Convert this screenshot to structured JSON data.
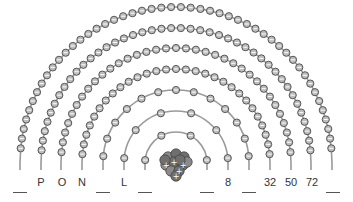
{
  "nucleus": {
    "center_x": 176,
    "center_y": 163,
    "radius": 14,
    "color": "#6f6f6f",
    "symbol": "+"
  },
  "colors": {
    "shell": "#9a9a9a",
    "electron_fill": "#bdbdbd",
    "electron_stroke": "#555555",
    "label": "#333333"
  },
  "shells": [
    {
      "name": "K",
      "radius": 31,
      "electrons": 2
    },
    {
      "name": "L",
      "radius": 52,
      "electrons": 8
    },
    {
      "name": "M",
      "radius": 73,
      "electrons": 18
    },
    {
      "name": "N",
      "radius": 94,
      "electrons": 32
    },
    {
      "name": "O",
      "radius": 115,
      "electrons": 50
    },
    {
      "name": "P",
      "radius": 135,
      "electrons": 72
    },
    {
      "name": "Q",
      "radius": 156,
      "electrons": 98
    }
  ],
  "left_labels": [
    {
      "x": 20,
      "text": "",
      "blank": true
    },
    {
      "x": 41,
      "text": "P",
      "blank": false
    },
    {
      "x": 62,
      "text": "O",
      "blank": false
    },
    {
      "x": 82,
      "text": "N",
      "blank": false
    },
    {
      "x": 103,
      "text": "",
      "blank": true
    },
    {
      "x": 124,
      "text": "L",
      "blank": false
    },
    {
      "x": 145,
      "text": "",
      "blank": true
    }
  ],
  "right_labels": [
    {
      "x": 207,
      "text": "",
      "blank": true
    },
    {
      "x": 228,
      "text": "8",
      "blank": false
    },
    {
      "x": 249,
      "text": "",
      "blank": true
    },
    {
      "x": 270,
      "text": "32",
      "blank": false
    },
    {
      "x": 291,
      "text": "50",
      "blank": false
    },
    {
      "x": 312,
      "text": "72",
      "blank": false
    },
    {
      "x": 333,
      "text": "",
      "blank": true
    }
  ]
}
